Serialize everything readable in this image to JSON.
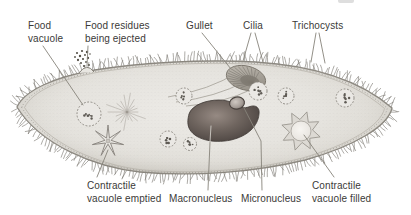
{
  "diagram": {
    "labels": {
      "food_vacuole": "Food vacuole",
      "food_residues": "Food residues being ejected",
      "gullet": "Gullet",
      "cilia": "Cilia",
      "trichocysts": "Trichocysts",
      "contractile_vacuole_emptied": "Contractile vacuole emptied",
      "macronucleus": "Macronucleus",
      "micronucleus": "Micronucleus",
      "contractile_vacuole_filled": "Contractile vacuole filled"
    },
    "palette": {
      "background": "#ffffff",
      "cell_body": "#e6e4df",
      "cell_outline": "#87837b",
      "macronucleus": "#4a423e",
      "label_text": "#3b3a38",
      "leader_line": "#87837b"
    }
  }
}
